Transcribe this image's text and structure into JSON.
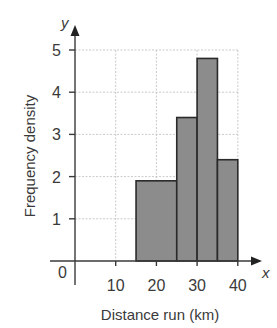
{
  "chart_data": {
    "type": "bar",
    "subtype": "histogram",
    "title": "",
    "xlabel": "Distance run (km)",
    "ylabel": "Frequency density",
    "x_axis_letter": "x",
    "y_axis_letter": "y",
    "origin_label": "0",
    "xlim": [
      0,
      40
    ],
    "ylim": [
      0,
      5
    ],
    "x_ticks": [
      10,
      20,
      30,
      40
    ],
    "y_ticks": [
      1,
      2,
      3,
      4,
      5
    ],
    "grid": true,
    "legend": null,
    "bins": [
      {
        "from": 15,
        "to": 25,
        "frequency_density": 1.9
      },
      {
        "from": 25,
        "to": 30,
        "frequency_density": 3.4
      },
      {
        "from": 30,
        "to": 35,
        "frequency_density": 4.8
      },
      {
        "from": 35,
        "to": 40,
        "frequency_density": 2.4
      }
    ],
    "categories": [
      "15-25",
      "25-30",
      "30-35",
      "35-40"
    ],
    "values": [
      1.9,
      3.4,
      4.8,
      2.4
    ],
    "colors": {
      "bar_fill": "#8c8c8c",
      "bar_stroke": "#2a2a2a",
      "axis": "#3a3a3a",
      "grid": "#bdbdbd"
    }
  }
}
